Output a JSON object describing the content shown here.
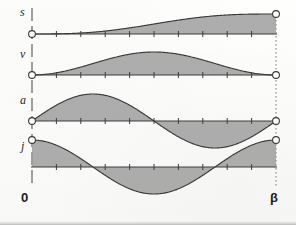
{
  "figure": {
    "title_visible": false,
    "background_color": "#fdfdfc",
    "curve_fill_color": "#9b9b9b",
    "curve_stroke_color": "#3a3a3a",
    "axis_color": "#565656",
    "marker_fill_color": "#ffffff"
  },
  "axes": {
    "labels": [
      {
        "key": "s",
        "text": "s",
        "meaning": "displacement"
      },
      {
        "key": "v",
        "text": "v",
        "meaning": "velocity"
      },
      {
        "key": "a",
        "text": "a",
        "meaning": "acceleration"
      },
      {
        "key": "j",
        "text": "j",
        "meaning": "jerk"
      }
    ],
    "x_start_label": "0",
    "x_end_label": "β",
    "tick_count": 10
  },
  "chart_data": {
    "type": "line",
    "title": "",
    "subtitle": "",
    "xlabel": "",
    "ylabel": "",
    "xlim": [
      0,
      1
    ],
    "ylim": [
      -1,
      1
    ],
    "grid": false,
    "legend": false,
    "x_tick_labels": [
      "0",
      "β"
    ],
    "x_ticks_minor": 10,
    "annotations": [
      {
        "text": "0",
        "x": 0,
        "position": "below-axis-left"
      },
      {
        "text": "β",
        "x": 1,
        "position": "below-axis-right"
      }
    ],
    "panels": [
      {
        "name": "s",
        "label": "s",
        "description": "Cycloidal displacement: s = x - sin(2πx)/(2π); rises monotonically from 0 to 1",
        "formula": "x - sin(2*pi*x)/(2*pi)",
        "ylim": [
          0,
          1
        ],
        "y_at_start": 0,
        "y_at_end": 1,
        "fill": "above-axis",
        "markers": [
          {
            "x": 0,
            "y": 0
          },
          {
            "x": 1,
            "y": 1
          }
        ],
        "x": [
          0,
          0.05,
          0.1,
          0.15,
          0.2,
          0.25,
          0.3,
          0.35,
          0.4,
          0.45,
          0.5,
          0.55,
          0.6,
          0.65,
          0.7,
          0.75,
          0.8,
          0.85,
          0.9,
          0.95,
          1
        ],
        "y": [
          0,
          0.0013,
          0.0099,
          0.0323,
          0.0728,
          0.1338,
          0.2154,
          0.3158,
          0.4309,
          0.5551,
          0.6817,
          0.8038,
          0.9154,
          1.0111,
          1.0877,
          1.1438,
          1.1796,
          1.1973,
          1.2006,
          1.1937,
          1.1817
        ]
      },
      {
        "name": "v",
        "label": "v",
        "description": "Velocity: v = 1 - cos(2πx); one full positive hump, zero at both ends",
        "formula": "1 - cos(2*pi*x)",
        "ylim": [
          0,
          2
        ],
        "y_at_start": 0,
        "y_at_end": 0,
        "fill": "above-axis",
        "markers": [
          {
            "x": 0,
            "y": 0
          },
          {
            "x": 1,
            "y": 0
          }
        ],
        "x": [
          0,
          0.05,
          0.1,
          0.15,
          0.2,
          0.25,
          0.3,
          0.35,
          0.4,
          0.45,
          0.5,
          0.55,
          0.6,
          0.65,
          0.7,
          0.75,
          0.8,
          0.85,
          0.9,
          0.95,
          1
        ],
        "y": [
          0,
          0.0489,
          0.191,
          0.4122,
          0.691,
          1.0,
          1.309,
          1.5878,
          1.809,
          1.9511,
          2.0,
          1.9511,
          1.809,
          1.5878,
          1.309,
          1.0,
          0.691,
          0.4122,
          0.191,
          0.0489,
          0
        ]
      },
      {
        "name": "a",
        "label": "a",
        "description": "Acceleration: a = sin(2πx); full sine wave, positive first half, negative second half",
        "formula": "sin(2*pi*x)",
        "ylim": [
          -1,
          1
        ],
        "y_at_start": 0,
        "y_at_end": 0,
        "fill": "between-curve-and-axis",
        "markers": [
          {
            "x": 0,
            "y": 0
          },
          {
            "x": 1,
            "y": 0
          }
        ],
        "x": [
          0,
          0.05,
          0.1,
          0.15,
          0.2,
          0.25,
          0.3,
          0.35,
          0.4,
          0.45,
          0.5,
          0.55,
          0.6,
          0.65,
          0.7,
          0.75,
          0.8,
          0.85,
          0.9,
          0.95,
          1
        ],
        "y": [
          0,
          0.309,
          0.5878,
          0.809,
          0.9511,
          1.0,
          0.9511,
          0.809,
          0.5878,
          0.309,
          0,
          -0.309,
          -0.5878,
          -0.809,
          -0.9511,
          -1.0,
          -0.9511,
          -0.809,
          -0.5878,
          -0.309,
          0
        ]
      },
      {
        "name": "j",
        "label": "j",
        "description": "Jerk: j = cos(2πx); starts at maximum, negative through the middle, returns to maximum",
        "formula": "cos(2*pi*x)",
        "ylim": [
          -1,
          1
        ],
        "y_at_start": 1,
        "y_at_end": 1,
        "fill": "between-curve-and-axis",
        "markers": [
          {
            "x": 0,
            "y": 1
          },
          {
            "x": 1,
            "y": 1
          }
        ],
        "x": [
          0,
          0.05,
          0.1,
          0.15,
          0.2,
          0.25,
          0.3,
          0.35,
          0.4,
          0.45,
          0.5,
          0.55,
          0.6,
          0.65,
          0.7,
          0.75,
          0.8,
          0.85,
          0.9,
          0.95,
          1
        ],
        "y": [
          1.0,
          0.9511,
          0.809,
          0.5878,
          0.309,
          0,
          -0.309,
          -0.5878,
          -0.809,
          -0.9511,
          -1.0,
          -0.9511,
          -0.809,
          -0.5878,
          -0.309,
          0,
          0.309,
          0.5878,
          0.809,
          0.9511,
          1.0
        ]
      }
    ]
  },
  "geometry": {
    "x_axis_left": 32,
    "x_axis_right": 276,
    "baselines": {
      "s": 34,
      "v": 75,
      "a": 121,
      "j": 167
    },
    "amplitudes": {
      "s": 20,
      "v": 23,
      "a": 27,
      "j": 27
    }
  }
}
